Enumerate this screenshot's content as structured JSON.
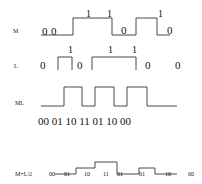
{
  "diagram": {
    "rows": [
      {
        "id": "M",
        "label": "M",
        "label_pos": [
          13,
          33
        ],
        "wave_points": [
          [
            41,
            35
          ],
          [
            73,
            35
          ],
          [
            73,
            18
          ],
          [
            112,
            18
          ],
          [
            112,
            35
          ],
          [
            136,
            35
          ],
          [
            136,
            18
          ],
          [
            157,
            18
          ],
          [
            157,
            35
          ],
          [
            170,
            35
          ]
        ],
        "bits": [
          {
            "text": "0",
            "x": 42,
            "y": 35,
            "size": "big"
          },
          {
            "text": "0",
            "x": 51,
            "y": 35,
            "size": "big"
          },
          {
            "text": "1",
            "x": 86,
            "y": 17,
            "size": "mid"
          },
          {
            "text": "1",
            "x": 107,
            "y": 17,
            "size": "mid"
          },
          {
            "text": "0",
            "x": 121,
            "y": 34,
            "size": "big"
          },
          {
            "text": "1",
            "x": 158,
            "y": 17,
            "size": "mid"
          },
          {
            "text": "0",
            "x": 167,
            "y": 34,
            "size": "big"
          }
        ]
      },
      {
        "id": "L",
        "label": "L",
        "label_pos": [
          14,
          68
        ],
        "segments": [
          [
            [
              58,
              70
            ],
            [
              58,
              57
            ],
            [
              72,
              57
            ],
            [
              72,
              70
            ]
          ],
          [
            [
              92,
              70
            ],
            [
              92,
              57
            ],
            [
              136,
              57
            ],
            [
              136,
              70
            ]
          ]
        ],
        "bits": [
          {
            "text": "0",
            "x": 40,
            "y": 69,
            "size": "big"
          },
          {
            "text": "1",
            "x": 68,
            "y": 53,
            "size": "mid"
          },
          {
            "text": "0",
            "x": 77,
            "y": 69,
            "size": "big"
          },
          {
            "text": "1",
            "x": 108,
            "y": 53,
            "size": "mid"
          },
          {
            "text": "1",
            "x": 132,
            "y": 53,
            "size": "mid"
          },
          {
            "text": "0",
            "x": 145,
            "y": 69,
            "size": "big"
          },
          {
            "text": "0",
            "x": 175,
            "y": 69,
            "size": "big"
          }
        ]
      },
      {
        "id": "ML",
        "label": "ML",
        "label_pos": [
          15,
          105
        ],
        "wave_points": [
          [
            41,
            106
          ],
          [
            64,
            106
          ],
          [
            64,
            87
          ],
          [
            82,
            87
          ],
          [
            82,
            106
          ],
          [
            95,
            106
          ],
          [
            95,
            87
          ],
          [
            114,
            87
          ],
          [
            114,
            106
          ],
          [
            127,
            106
          ],
          [
            127,
            87
          ],
          [
            147,
            87
          ],
          [
            147,
            106
          ],
          [
            177,
            106
          ]
        ],
        "sequence": {
          "text": "00 01 10  11 01 10 00",
          "x": 38,
          "y": 125
        }
      },
      {
        "id": "M+L/2",
        "label": "M+L/2",
        "label_pos": [
          15,
          176
        ],
        "wave_points": [
          [
            55,
            174
          ],
          [
            76,
            174
          ],
          [
            76,
            168
          ],
          [
            95,
            168
          ],
          [
            95,
            162
          ],
          [
            117,
            162
          ],
          [
            117,
            174
          ],
          [
            139,
            174
          ],
          [
            139,
            168
          ],
          [
            155,
            168
          ],
          [
            155,
            174
          ],
          [
            177,
            174
          ]
        ],
        "bits": [
          {
            "text": "00",
            "x": 49,
            "y": 176,
            "size": "small"
          },
          {
            "text": "01",
            "x": 64,
            "y": 176,
            "size": "small"
          },
          {
            "text": "10",
            "x": 84,
            "y": 176,
            "size": "small"
          },
          {
            "text": "11",
            "x": 103,
            "y": 176,
            "size": "small"
          },
          {
            "text": "01",
            "x": 117,
            "y": 176,
            "size": "small"
          },
          {
            "text": "01",
            "x": 139,
            "y": 176,
            "size": "small"
          },
          {
            "text": "10",
            "x": 165,
            "y": 176,
            "size": "small"
          },
          {
            "text": "00",
            "x": 188,
            "y": 176,
            "size": "small"
          }
        ]
      }
    ],
    "colors": {
      "stroke": "#333333",
      "text": "#111111",
      "background": "#ffffff"
    }
  }
}
